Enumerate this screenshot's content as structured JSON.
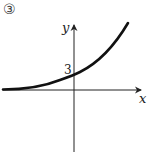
{
  "figure": {
    "number_label": "③",
    "x_axis_label": "x",
    "y_axis_label": "y",
    "y_intercept_label": "3",
    "curve_description": "increasing exponential curve, horizontal asymptote below, passing through y-intercept 3",
    "colors": {
      "curve": "#111111",
      "axes": "#222222",
      "background": "#ffffff"
    }
  }
}
